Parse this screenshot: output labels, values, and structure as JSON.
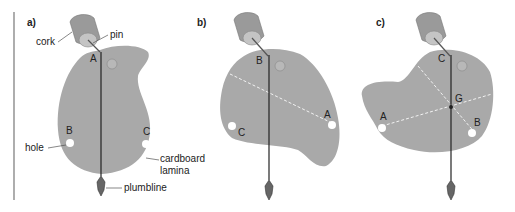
{
  "panels": [
    {
      "label": "a)",
      "pivot": "A",
      "points": [
        "A",
        "B",
        "C"
      ]
    },
    {
      "label": "b)",
      "pivot": "B",
      "points": [
        "B",
        "A",
        "C"
      ]
    },
    {
      "label": "c)",
      "pivot": "C",
      "points": [
        "C",
        "A",
        "B",
        "G"
      ]
    }
  ],
  "annotations": {
    "cork": "cork",
    "pin": "pin",
    "hole": "hole",
    "lamina_line1": "cardboard",
    "lamina_line2": "lamina",
    "plumbline": "plumbline"
  },
  "colors": {
    "lamina": "#a9a9a9",
    "cork": "#9a9a9a",
    "line": "#222222",
    "dashed": "#f2f2f2",
    "margin_rule": "#777777"
  }
}
